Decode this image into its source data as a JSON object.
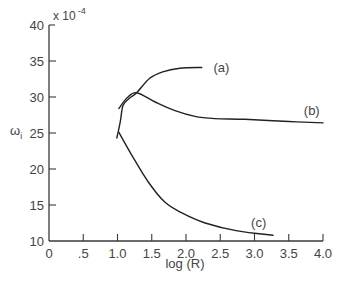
{
  "chart_data": {
    "type": "line",
    "title": "",
    "xlabel": "log (R)",
    "ylabel": "ω",
    "ylabel_subscript": "i",
    "y_multiplier": "x 10",
    "y_multiplier_exponent": "-4",
    "xlim": [
      0,
      4.0
    ],
    "ylim": [
      10,
      40
    ],
    "grid": false,
    "legend": "inline labels",
    "x_ticks": [
      0,
      0.5,
      1.0,
      1.5,
      2.0,
      2.5,
      3.0,
      3.5,
      4.0
    ],
    "x_tick_labels": [
      "0",
      ".5",
      "1.0",
      "1.5",
      "2.0",
      "2.5",
      "3.0",
      "3.5",
      "4.0"
    ],
    "y_ticks": [
      10,
      15,
      20,
      25,
      30,
      35,
      40
    ],
    "y_tick_labels": [
      "10",
      "15",
      "20",
      "25",
      "30",
      "35",
      "40"
    ],
    "series": [
      {
        "name": "(a)",
        "x": [
          0.99,
          1.04,
          1.08,
          1.17,
          1.28,
          1.47,
          1.66,
          1.91,
          2.23
        ],
        "values": [
          24.3,
          26.5,
          28.8,
          29.8,
          30.6,
          32.6,
          33.5,
          34.0,
          34.1
        ],
        "label_pos": [
          2.4,
          34.1
        ]
      },
      {
        "name": "(b)",
        "x": [
          1.02,
          1.14,
          1.28,
          1.55,
          1.84,
          2.13,
          2.42,
          2.86,
          3.5,
          4.0
        ],
        "values": [
          28.4,
          29.9,
          30.6,
          29.3,
          28.1,
          27.3,
          27.0,
          26.9,
          26.6,
          26.4
        ],
        "label_pos": [
          3.72,
          28.2
        ]
      },
      {
        "name": "(c)",
        "x": [
          1.02,
          1.21,
          1.45,
          1.69,
          1.94,
          2.28,
          2.75,
          3.27
        ],
        "values": [
          25.1,
          21.9,
          18.2,
          15.4,
          13.9,
          12.5,
          11.4,
          10.8
        ],
        "label_pos": [
          2.95,
          12.6
        ]
      }
    ]
  }
}
